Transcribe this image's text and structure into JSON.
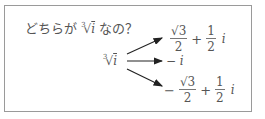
{
  "question": {
    "prefix": "どちらが",
    "root_index": "3",
    "radical": "√",
    "radicand": "i",
    "suffix": " なの？"
  },
  "source": {
    "root_index": "3",
    "radical": "√",
    "radicand": "i"
  },
  "results": [
    {
      "sign": "",
      "num1": "√3",
      "den1": "2",
      "op": "+",
      "num2": "1",
      "den2": "2",
      "unit": "i"
    },
    {
      "text": "− i"
    },
    {
      "sign": "−",
      "num1": "√3",
      "den1": "2",
      "op": "+",
      "num2": "1",
      "den2": "2",
      "unit": "i"
    }
  ],
  "colors": {
    "border": "#9a9a9a",
    "text": "#555555",
    "arrow": "#222222"
  }
}
